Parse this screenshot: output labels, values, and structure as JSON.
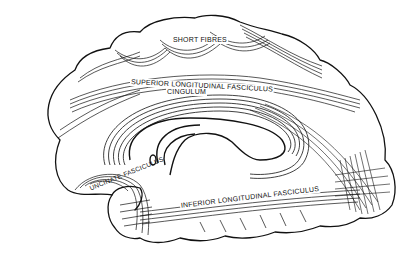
{
  "diagram": {
    "line_color": "#111111",
    "background": "#ffffff",
    "labels": {
      "short_fibres": "SHORT FIBRES",
      "superior_longitudinal": "SUPERIOR LONGITUDINAL FASCICULUS",
      "cingulum": "CINGULUM",
      "uncinate": "UNCINATE FASCICULUS",
      "inferior_longitudinal": "INFERIOR LONGITUDINAL FASCICULUS"
    }
  }
}
